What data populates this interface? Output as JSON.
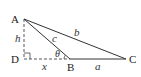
{
  "diagram": {
    "type": "triangle-with-altitude",
    "points": {
      "A": {
        "label": "A",
        "x": 24,
        "y": 19
      },
      "B": {
        "label": "B",
        "x": 70,
        "y": 59
      },
      "C": {
        "label": "C",
        "x": 126,
        "y": 59
      },
      "D": {
        "label": "D",
        "x": 24,
        "y": 59
      }
    },
    "segments": {
      "a": {
        "label": "a",
        "from": "B",
        "to": "C",
        "style": "solid"
      },
      "b": {
        "label": "b",
        "from": "A",
        "to": "C",
        "style": "solid"
      },
      "c": {
        "label": "c",
        "from": "A",
        "to": "B",
        "style": "solid"
      },
      "h": {
        "label": "h",
        "from": "A",
        "to": "D",
        "style": "dashed"
      },
      "x": {
        "label": "x",
        "from": "D",
        "to": "B",
        "style": "dashed"
      }
    },
    "angle": {
      "label": "θ",
      "vertex": "B"
    },
    "right_angle_at": "D",
    "colors": {
      "stroke": "#333333",
      "text": "#222222",
      "background": "#ffffff"
    }
  }
}
